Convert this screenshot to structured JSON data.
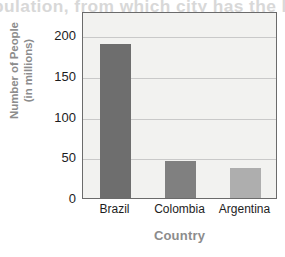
{
  "chart_data": {
    "type": "bar",
    "title": "",
    "xlabel": "Country",
    "ylabel": "Number of People",
    "ylabel_line2": "(in millions)",
    "categories": [
      "Brazil",
      "Colombia",
      "Argentina"
    ],
    "values": [
      190,
      45,
      37
    ],
    "ylim": [
      0,
      230
    ],
    "yticks": [
      0,
      50,
      100,
      150,
      200
    ],
    "ytick_labels": [
      "0",
      "50",
      "100",
      "150",
      "200"
    ],
    "grid": "horizontal",
    "legend": "none",
    "bar_colors": [
      "#6e6e6e",
      "#808080",
      "#aeaeae"
    ],
    "plot_background": "#f2f2f0",
    "frame_color": "#6b6b6b",
    "gridline_color": "#c9c9c9",
    "axis_title_color": "#8c8c8c",
    "tick_label_color": "#1d1d1d"
  },
  "background_artifacts": {
    "top_ghost_text": "pulation, from which city has the l",
    "mid_ghost_text_1": "A caus",
    "mid_ghost_text_2": "A effec"
  }
}
